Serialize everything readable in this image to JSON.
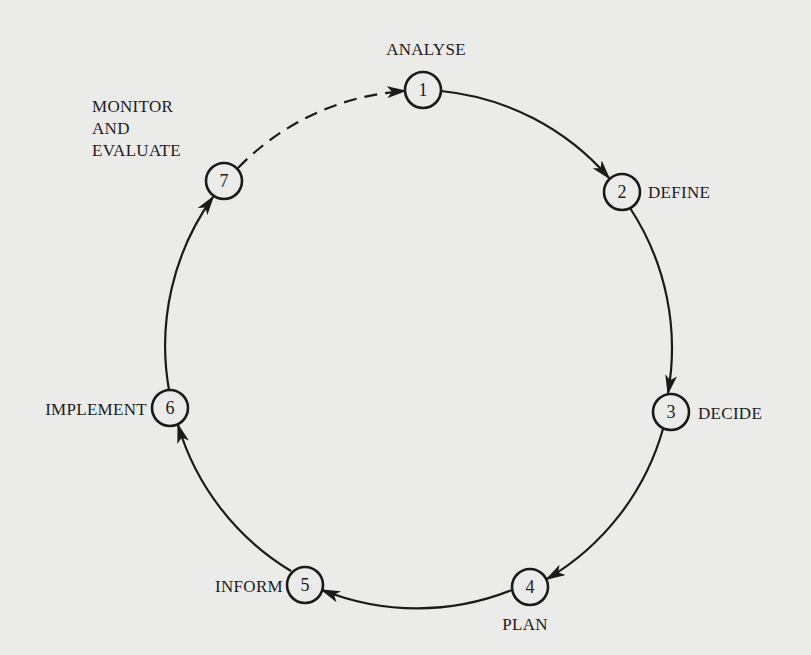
{
  "diagram": {
    "colors": {
      "background": "#ebebea",
      "ink": "#1a1a1a"
    },
    "nodes": [
      {
        "id": 1,
        "number": "1",
        "label": "ANALYSE"
      },
      {
        "id": 2,
        "number": "2",
        "label": "DEFINE"
      },
      {
        "id": 3,
        "number": "3",
        "label": "DECIDE"
      },
      {
        "id": 4,
        "number": "4",
        "label": "PLAN"
      },
      {
        "id": 5,
        "number": "5",
        "label": "INFORM"
      },
      {
        "id": 6,
        "number": "6",
        "label": "IMPLEMENT"
      },
      {
        "id": 7,
        "number": "7",
        "label_lines": [
          "MONITOR",
          "AND",
          "EVALUATE"
        ]
      }
    ],
    "edges": [
      {
        "from": 1,
        "to": 2,
        "style": "solid"
      },
      {
        "from": 2,
        "to": 3,
        "style": "solid"
      },
      {
        "from": 3,
        "to": 4,
        "style": "solid"
      },
      {
        "from": 4,
        "to": 5,
        "style": "solid"
      },
      {
        "from": 5,
        "to": 6,
        "style": "solid"
      },
      {
        "from": 6,
        "to": 7,
        "style": "solid"
      },
      {
        "from": 7,
        "to": 1,
        "style": "dashed"
      }
    ]
  }
}
